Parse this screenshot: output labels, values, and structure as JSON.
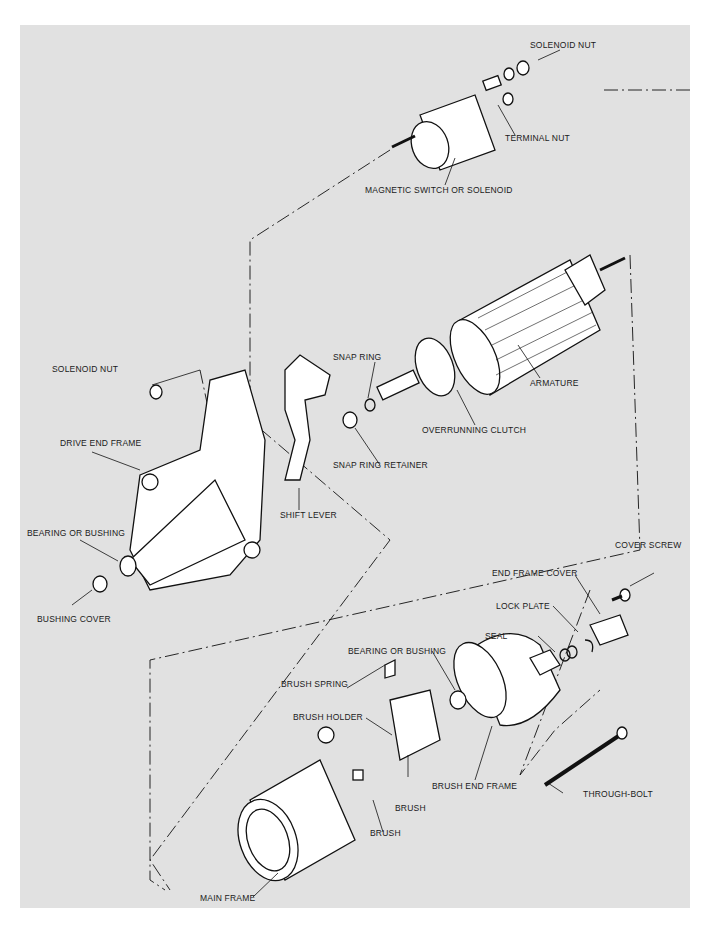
{
  "diagram": {
    "type": "exploded-view",
    "colors": {
      "panel": "#e1e1e1",
      "line": "#111111",
      "part_fill": "#ffffff"
    },
    "labels": {
      "solenoid_nut_top": "SOLENOID NUT",
      "terminal_nut": "TERMINAL NUT",
      "magnetic_switch": "MAGNETIC SWITCH OR SOLENOID",
      "solenoid_nut_left": "SOLENOID NUT",
      "snap_ring": "SNAP RING",
      "armature": "ARMATURE",
      "drive_end_frame": "DRIVE END FRAME",
      "overrunning_clutch": "OVERRUNNING CLUTCH",
      "snap_ring_retainer": "SNAP RING RETAINER",
      "shift_lever": "SHIFT LEVER",
      "bearing_bushing_front": "BEARING OR BUSHING",
      "bushing_cover": "BUSHING COVER",
      "cover_screw": "COVER SCREW",
      "end_frame_cover": "END FRAME COVER",
      "lock_plate": "LOCK PLATE",
      "seal": "SEAL",
      "bearing_bushing_rear": "BEARING OR BUSHING",
      "brush_spring": "BRUSH SPRING",
      "brush_holder": "BRUSH HOLDER",
      "brush_end_frame": "BRUSH END FRAME",
      "brush_a": "BRUSH",
      "through_bolt": "THROUGH-BOLT",
      "brush_b": "BRUSH",
      "main_frame": "MAIN FRAME"
    }
  }
}
